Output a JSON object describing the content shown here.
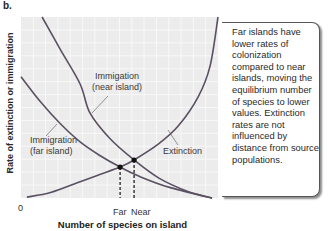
{
  "panel_label": "b.",
  "colors": {
    "plot_bg": "#ececec",
    "grid": "#f8f8f8",
    "curve": "#5a5062",
    "leader": "#7a7a7a",
    "dot": "#111111"
  },
  "callout_text": "Far islands have lower rates of colonization compared to near islands, moving the equilibrium number of species to lower values. Extinction rates are not influenced by distance from source populations.",
  "chart_data": {
    "type": "line",
    "title": "",
    "xlabel": "Number of species on island",
    "ylabel": "Rate of extinction or immigration",
    "xlim": [
      0,
      10
    ],
    "ylim": [
      0,
      10
    ],
    "grid": true,
    "x_tick_labels": [
      {
        "x": 0,
        "label": "0"
      },
      {
        "x": 5.03,
        "label": "Far"
      },
      {
        "x": 5.74,
        "label": "Near"
      }
    ],
    "series": [
      {
        "name": "Immigation (near island)",
        "label_lines": [
          "Immigation",
          "(near island)"
        ],
        "points": [
          [
            1.07,
            10
          ],
          [
            2.0,
            8.2
          ],
          [
            3.0,
            6.3
          ],
          [
            3.5,
            4.7
          ],
          [
            4.5,
            3.3
          ],
          [
            5.74,
            2.1
          ],
          [
            7.0,
            1.1
          ],
          [
            8.5,
            0.35
          ],
          [
            9.7,
            0.0
          ]
        ]
      },
      {
        "name": "Immigration (far island)",
        "label_lines": [
          "Immigration",
          "(far island)"
        ],
        "points": [
          [
            0,
            6.7
          ],
          [
            1.0,
            5.3
          ],
          [
            2.0,
            4.1
          ],
          [
            3.0,
            3.1
          ],
          [
            4.0,
            2.35
          ],
          [
            5.03,
            1.71
          ],
          [
            6.0,
            1.2
          ],
          [
            7.5,
            0.6
          ],
          [
            9.7,
            0.0
          ]
        ]
      },
      {
        "name": "Extinction",
        "label_lines": [
          "Extinction"
        ],
        "points": [
          [
            0.3,
            0.05
          ],
          [
            1.5,
            0.3
          ],
          [
            3.0,
            0.9
          ],
          [
            4.0,
            1.3
          ],
          [
            5.03,
            1.71
          ],
          [
            5.74,
            2.1
          ],
          [
            7.0,
            3.0
          ],
          [
            8.0,
            4.0
          ],
          [
            9.0,
            5.6
          ],
          [
            9.6,
            7.3
          ],
          [
            10.0,
            10
          ]
        ]
      }
    ],
    "equilibria": [
      {
        "name": "Far",
        "x": 5.03,
        "y": 1.71
      },
      {
        "name": "Near",
        "x": 5.74,
        "y": 2.1
      }
    ]
  }
}
